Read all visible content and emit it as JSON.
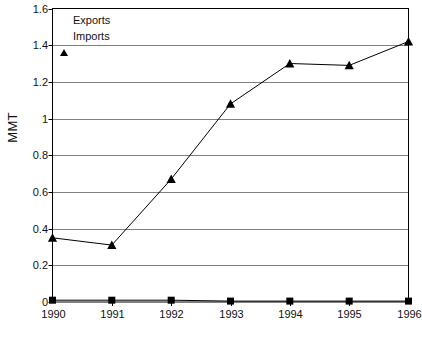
{
  "chart_data": {
    "type": "line",
    "title": "",
    "xlabel": "",
    "ylabel": "MMT",
    "categories": [
      "1990",
      "1991",
      "1992",
      "1993",
      "1994",
      "1995",
      "1996"
    ],
    "x": [
      1990,
      1991,
      1992,
      1993,
      1994,
      1995,
      1996
    ],
    "ylim": [
      0,
      1.6
    ],
    "ytick_labels": [
      "0",
      "0.2",
      "0.4",
      "0.6",
      "0.8",
      "1",
      "1.2",
      "1.4",
      "1.6"
    ],
    "ytick_values": [
      0,
      0.2,
      0.4,
      0.6,
      0.8,
      1.0,
      1.2,
      1.4,
      1.6
    ],
    "grid": "horizontal",
    "legend_position": "top-left-inside",
    "series": [
      {
        "name": "Exports",
        "marker": "square",
        "color": "#000000",
        "values": [
          0.01,
          0.01,
          0.01,
          0.005,
          0.005,
          0.005,
          0.005
        ]
      },
      {
        "name": "Imports",
        "marker": "triangle",
        "color": "#000000",
        "values": [
          0.35,
          0.31,
          0.67,
          1.08,
          1.3,
          1.29,
          1.42
        ]
      }
    ]
  },
  "legend": {
    "items": [
      {
        "label": "Exports",
        "marker": "square-marker-icon"
      },
      {
        "label": "Imports",
        "marker": "triangle-marker-icon"
      }
    ]
  },
  "axes": {
    "y_title": "MMT"
  },
  "colors": {
    "gridline": "#808080",
    "frame": "#000000",
    "series": "#000000",
    "background": "#ffffff"
  }
}
